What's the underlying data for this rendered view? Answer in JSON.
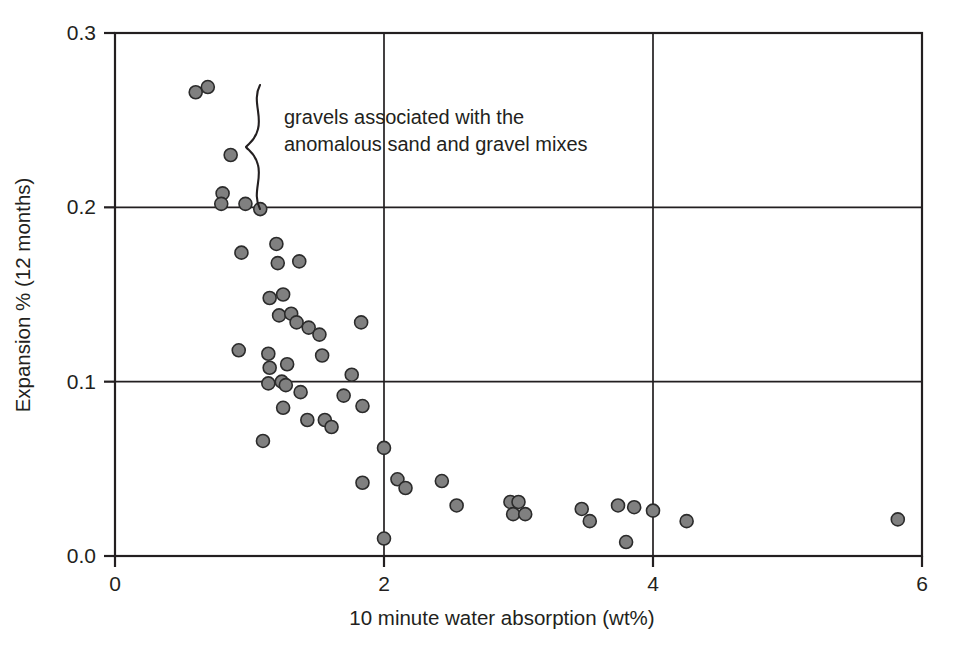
{
  "chart_data": {
    "type": "scatter",
    "title": "",
    "xlabel": "10 minute water absorption (wt%)",
    "ylabel": "Expansion % (12 months)",
    "xlim": [
      0,
      6
    ],
    "ylim": [
      0.0,
      0.3
    ],
    "xticks": [
      0,
      2,
      4,
      6
    ],
    "xtick_labels": [
      "0",
      "2",
      "4",
      "6"
    ],
    "yticks": [
      0.0,
      0.1,
      0.2,
      0.3
    ],
    "ytick_labels": [
      "0.0",
      "0.1",
      "0.2",
      "0.3"
    ],
    "grid": "major gridlines at x=2, x=4 and y=0.1, y=0.2",
    "legend": "none",
    "marker_fill": "#808080",
    "marker_edge": "#2b2b2b",
    "marker_size_px": 13,
    "annotations": [
      {
        "name": "gravel-brace-annotation",
        "line1": "gravels associated with the",
        "line2": "anomalous sand and gravel mixes",
        "brace": "curly brace spanning y = 0.198 to 0.272 at x = 1.08"
      }
    ],
    "points": [
      {
        "x": 0.6,
        "y": 0.266
      },
      {
        "x": 0.69,
        "y": 0.269
      },
      {
        "x": 0.86,
        "y": 0.23
      },
      {
        "x": 0.8,
        "y": 0.208
      },
      {
        "x": 0.79,
        "y": 0.202
      },
      {
        "x": 0.97,
        "y": 0.202
      },
      {
        "x": 1.08,
        "y": 0.199
      },
      {
        "x": 0.94,
        "y": 0.174
      },
      {
        "x": 1.2,
        "y": 0.179
      },
      {
        "x": 1.21,
        "y": 0.168
      },
      {
        "x": 1.37,
        "y": 0.169
      },
      {
        "x": 1.15,
        "y": 0.148
      },
      {
        "x": 1.25,
        "y": 0.15
      },
      {
        "x": 1.22,
        "y": 0.138
      },
      {
        "x": 1.31,
        "y": 0.139
      },
      {
        "x": 1.35,
        "y": 0.134
      },
      {
        "x": 1.44,
        "y": 0.131
      },
      {
        "x": 1.52,
        "y": 0.127
      },
      {
        "x": 1.83,
        "y": 0.134
      },
      {
        "x": 0.92,
        "y": 0.118
      },
      {
        "x": 1.54,
        "y": 0.115
      },
      {
        "x": 1.14,
        "y": 0.116
      },
      {
        "x": 1.15,
        "y": 0.108
      },
      {
        "x": 1.28,
        "y": 0.11
      },
      {
        "x": 1.76,
        "y": 0.104
      },
      {
        "x": 1.14,
        "y": 0.099
      },
      {
        "x": 1.24,
        "y": 0.1
      },
      {
        "x": 1.27,
        "y": 0.098
      },
      {
        "x": 1.38,
        "y": 0.094
      },
      {
        "x": 1.7,
        "y": 0.092
      },
      {
        "x": 1.25,
        "y": 0.085
      },
      {
        "x": 1.84,
        "y": 0.086
      },
      {
        "x": 1.43,
        "y": 0.078
      },
      {
        "x": 1.56,
        "y": 0.078
      },
      {
        "x": 1.61,
        "y": 0.074
      },
      {
        "x": 1.1,
        "y": 0.066
      },
      {
        "x": 2.0,
        "y": 0.062
      },
      {
        "x": 1.84,
        "y": 0.042
      },
      {
        "x": 2.1,
        "y": 0.044
      },
      {
        "x": 2.16,
        "y": 0.039
      },
      {
        "x": 2.43,
        "y": 0.043
      },
      {
        "x": 2.54,
        "y": 0.029
      },
      {
        "x": 2.0,
        "y": 0.01
      },
      {
        "x": 2.94,
        "y": 0.031
      },
      {
        "x": 3.0,
        "y": 0.031
      },
      {
        "x": 2.96,
        "y": 0.024
      },
      {
        "x": 3.05,
        "y": 0.024
      },
      {
        "x": 3.47,
        "y": 0.027
      },
      {
        "x": 3.53,
        "y": 0.02
      },
      {
        "x": 3.74,
        "y": 0.029
      },
      {
        "x": 3.86,
        "y": 0.028
      },
      {
        "x": 3.8,
        "y": 0.008
      },
      {
        "x": 4.0,
        "y": 0.026
      },
      {
        "x": 4.25,
        "y": 0.02
      },
      {
        "x": 5.82,
        "y": 0.021
      }
    ]
  }
}
